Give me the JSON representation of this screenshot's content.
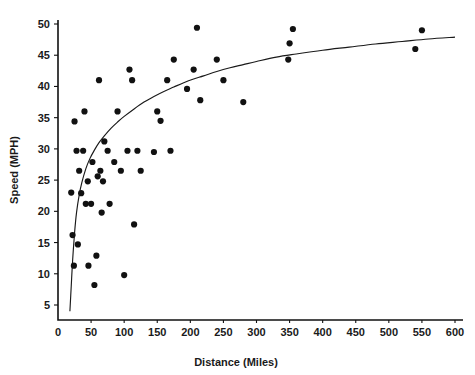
{
  "chart_data": {
    "type": "scatter",
    "title": "",
    "xlabel": "Distance (Miles)",
    "ylabel": "Speed (MPH)",
    "xlim": [
      0,
      600
    ],
    "ylim": [
      0,
      50
    ],
    "xticks": [
      0,
      50,
      100,
      150,
      200,
      250,
      300,
      350,
      400,
      450,
      500,
      550,
      600
    ],
    "yticks": [
      5,
      10,
      15,
      20,
      25,
      30,
      35,
      40,
      45,
      50
    ],
    "grid": false,
    "legend": null,
    "marker_color": "#111111",
    "curve_color": "#1a1a1a",
    "points": [
      [
        20,
        23.0
      ],
      [
        22,
        16.2
      ],
      [
        24,
        11.3
      ],
      [
        25,
        34.4
      ],
      [
        28,
        29.7
      ],
      [
        30,
        14.7
      ],
      [
        32,
        26.5
      ],
      [
        35,
        22.9
      ],
      [
        38,
        29.7
      ],
      [
        40,
        36.0
      ],
      [
        42,
        21.2
      ],
      [
        45,
        24.8
      ],
      [
        46,
        11.3
      ],
      [
        50,
        21.2
      ],
      [
        52,
        27.9
      ],
      [
        55,
        8.2
      ],
      [
        58,
        12.9
      ],
      [
        60,
        25.6
      ],
      [
        62,
        41.0
      ],
      [
        64,
        26.5
      ],
      [
        66,
        19.8
      ],
      [
        68,
        24.8
      ],
      [
        70,
        31.2
      ],
      [
        75,
        29.7
      ],
      [
        78,
        21.2
      ],
      [
        85,
        27.9
      ],
      [
        90,
        36.0
      ],
      [
        95,
        26.5
      ],
      [
        100,
        9.8
      ],
      [
        105,
        29.7
      ],
      [
        108,
        42.7
      ],
      [
        112,
        41.0
      ],
      [
        115,
        17.9
      ],
      [
        120,
        29.7
      ],
      [
        125,
        26.5
      ],
      [
        145,
        29.5
      ],
      [
        150,
        36.0
      ],
      [
        155,
        34.5
      ],
      [
        165,
        41.0
      ],
      [
        170,
        29.7
      ],
      [
        175,
        44.3
      ],
      [
        195,
        39.6
      ],
      [
        205,
        42.7
      ],
      [
        210,
        49.4
      ],
      [
        215,
        37.8
      ],
      [
        240,
        44.3
      ],
      [
        250,
        41.0
      ],
      [
        280,
        37.5
      ],
      [
        348,
        44.3
      ],
      [
        350,
        46.9
      ],
      [
        355,
        49.2
      ],
      [
        540,
        46.0
      ],
      [
        550,
        49.0
      ]
    ],
    "fit_curve": {
      "kind": "logarithmic",
      "description": "smooth increasing curve rising steeply from ~4 MPH near 18 miles, passing ~30 MPH near 70 miles and ~41 MPH near 170 miles, flattening to ~48 MPH by 600 miles",
      "points": [
        [
          18,
          4.0
        ],
        [
          20,
          8.0
        ],
        [
          22,
          12.0
        ],
        [
          25,
          16.5
        ],
        [
          28,
          19.8
        ],
        [
          32,
          22.6
        ],
        [
          36,
          24.6
        ],
        [
          42,
          26.8
        ],
        [
          48,
          28.4
        ],
        [
          55,
          29.8
        ],
        [
          62,
          31.0
        ],
        [
          70,
          32.1
        ],
        [
          80,
          33.3
        ],
        [
          90,
          34.3
        ],
        [
          100,
          35.2
        ],
        [
          115,
          36.4
        ],
        [
          130,
          37.5
        ],
        [
          145,
          38.4
        ],
        [
          160,
          39.2
        ],
        [
          175,
          39.9
        ],
        [
          190,
          40.6
        ],
        [
          205,
          41.2
        ],
        [
          220,
          41.7
        ],
        [
          240,
          42.4
        ],
        [
          260,
          43.0
        ],
        [
          280,
          43.5
        ],
        [
          300,
          44.0
        ],
        [
          330,
          44.7
        ],
        [
          360,
          45.2
        ],
        [
          400,
          45.8
        ],
        [
          440,
          46.3
        ],
        [
          480,
          46.8
        ],
        [
          520,
          47.2
        ],
        [
          560,
          47.6
        ],
        [
          600,
          47.9
        ]
      ]
    }
  }
}
